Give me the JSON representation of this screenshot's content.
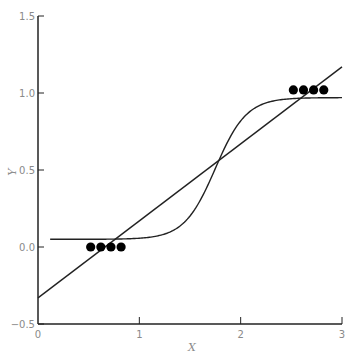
{
  "chart_data": {
    "type": "scatter",
    "title": "",
    "xlabel": "X",
    "ylabel": "Y",
    "xlim": [
      0,
      3
    ],
    "ylim": [
      -0.5,
      1.5
    ],
    "xticks": [
      "0",
      "1",
      "2",
      "3"
    ],
    "yticks": [
      "-0.5",
      "0.0",
      "0.5",
      "1.0",
      "1.5"
    ],
    "grid": false,
    "legend": null,
    "series": [
      {
        "name": "data points",
        "kind": "scatter",
        "x": [
          0.52,
          0.62,
          0.72,
          0.82,
          2.52,
          2.62,
          2.72,
          2.82
        ],
        "y": [
          0.0,
          0.0,
          0.0,
          0.0,
          1.02,
          1.02,
          1.02,
          1.02
        ]
      },
      {
        "name": "linear fit",
        "kind": "line",
        "x": [
          0,
          3
        ],
        "y": [
          -0.33,
          1.17
        ]
      },
      {
        "name": "logistic fit",
        "kind": "line",
        "x_range": [
          0.12,
          3.0
        ],
        "lower": 0.05,
        "upper": 0.97,
        "midpoint": 1.75,
        "steepness": 6.5
      }
    ]
  },
  "colors": {
    "line": "#222222",
    "point": "#000000",
    "axis": "#222222",
    "label": "#8a8a8a"
  }
}
